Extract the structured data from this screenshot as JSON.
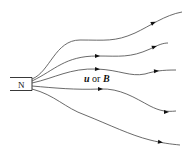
{
  "diagram": {
    "magnet": {
      "label": "N"
    },
    "field_label": {
      "u": "u",
      "or": " or ",
      "b": "B"
    },
    "field_lines": [
      {
        "id": "line-1",
        "path": "M32,79 C50,72 55,40 80,40 C105,40 115,42 135,33 C150,26 165,15 182,12",
        "arrows": [
          [
            153,
            23,
            -25
          ]
        ]
      },
      {
        "id": "line-2",
        "path": "M32,81 C55,70 65,56 97,56 C120,56 130,58 150,49 C158,45 163,43 168,43",
        "arrows": [
          [
            97,
            56,
            0
          ],
          [
            154,
            47,
            -20
          ]
        ]
      },
      {
        "id": "line-3",
        "path": "M32,83 C55,78 70,68 97,69 C120,70 130,77 145,74 C155,71 162,70 176,70",
        "arrows": [
          [
            97,
            69,
            3
          ],
          [
            156,
            71,
            -5
          ]
        ]
      },
      {
        "id": "line-4",
        "path": "M32,86 C55,88 75,90 100,89 C120,88 135,98 150,106 C160,111 166,112 176,111",
        "arrows": [
          [
            100,
            89,
            0
          ],
          [
            166,
            112,
            0
          ]
        ]
      },
      {
        "id": "line-5",
        "path": "M32,89 C55,95 65,108 85,115 C110,125 130,135 150,140 C162,143 170,144 180,145",
        "arrows": [
          [
            160,
            142,
            8
          ]
        ]
      }
    ],
    "colors": {
      "stroke": "#444444",
      "arrow": "#111111",
      "text": "#111111"
    }
  }
}
